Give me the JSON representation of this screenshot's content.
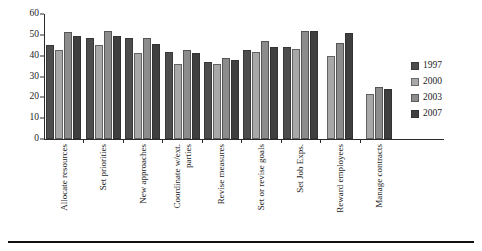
{
  "chart_data": {
    "type": "bar",
    "title": "",
    "xlabel": "",
    "ylabel": "",
    "ylim": [
      0,
      60
    ],
    "yticks": [
      0,
      10,
      20,
      30,
      40,
      50,
      60
    ],
    "grid": false,
    "legend_position": "right",
    "categories": [
      "Allocate resources",
      "Set priorities",
      "New approaches",
      "Coordinate w/ext. parties",
      "Revise measures",
      "Set or revise goals",
      "Set Job Exps.",
      "Reward employees",
      "Manage contracts"
    ],
    "series": [
      {
        "name": "1997",
        "color": "#4d4d4d",
        "values": [
          45,
          48.5,
          48.5,
          42,
          37,
          42.5,
          44,
          null,
          null
        ]
      },
      {
        "name": "2000",
        "color": "#a8a8a8",
        "values": [
          42.5,
          45,
          41.5,
          36,
          36,
          42,
          43,
          40,
          21.5
        ]
      },
      {
        "name": "2003",
        "color": "#8c8c8c",
        "values": [
          51.5,
          52,
          48.5,
          42.5,
          39,
          47,
          52,
          46,
          25
        ]
      },
      {
        "name": "2007",
        "color": "#3f3f3f",
        "values": [
          49.5,
          49.5,
          45.5,
          41.5,
          38,
          44,
          52,
          51,
          24
        ]
      }
    ]
  },
  "legend": {
    "items": [
      {
        "label": "1997",
        "color": "#4d4d4d"
      },
      {
        "label": "2000",
        "color": "#a8a8a8"
      },
      {
        "label": "2003",
        "color": "#8c8c8c"
      },
      {
        "label": "2007",
        "color": "#3f3f3f"
      }
    ]
  },
  "axis": {
    "y_tick_labels": [
      "60",
      "50",
      "40",
      "30",
      "20",
      "10",
      "0"
    ]
  },
  "x_axis_labels": [
    {
      "lines": [
        "Allocate resources"
      ]
    },
    {
      "lines": [
        "Set priorities"
      ]
    },
    {
      "lines": [
        "New approaches"
      ]
    },
    {
      "lines": [
        "Coordinate w/ext.",
        "parties"
      ]
    },
    {
      "lines": [
        "Revise measures"
      ]
    },
    {
      "lines": [
        "Set or revise goals"
      ]
    },
    {
      "lines": [
        "Set Job Exps."
      ]
    },
    {
      "lines": [
        "Reward employees"
      ]
    },
    {
      "lines": [
        "Manage contracts"
      ]
    }
  ]
}
